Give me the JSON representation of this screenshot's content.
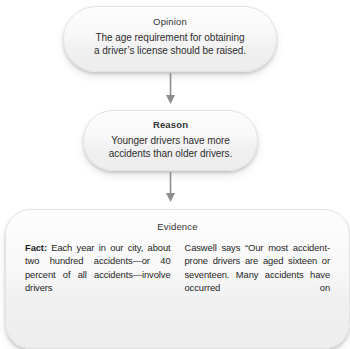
{
  "diagram": {
    "type": "flowchart-vertical",
    "nodes": [
      {
        "id": "opinion",
        "heading": "Opinion",
        "heading_bold": false,
        "lines": [
          "The age requirement for obtaining",
          "a driver’s license should be raised."
        ]
      },
      {
        "id": "reason",
        "heading": "Reason",
        "heading_bold": true,
        "lines": [
          "Younger drivers have more",
          "accidents than older drivers."
        ]
      },
      {
        "id": "evidence",
        "heading": "Evidence",
        "heading_bold": false,
        "columns": [
          {
            "id": "fact-column",
            "lead": "Fact:",
            "text": " Each year in our city, about two hundred accidents—or 40 percent of all accidents—involve drivers"
          },
          {
            "id": "quote-column",
            "lead": "",
            "text": "Caswell says “Our most accident-prone drivers are aged sixteen or seventeen. Many accidents have occurred on"
          }
        ]
      }
    ],
    "connectors": [
      {
        "id": "opinion-to-reason",
        "from": "opinion",
        "to": "reason",
        "direction": "down"
      },
      {
        "id": "reason-to-evidence",
        "from": "reason",
        "to": "evidence",
        "direction": "down"
      }
    ],
    "colors": {
      "node_fill_top": "#fdfdfd",
      "node_fill_bottom": "#ededed",
      "node_border": "#e2e2e2",
      "text": "#2e2e2e",
      "heading": "#333333",
      "arrow": "#8d8d8d",
      "background": "#ffffff"
    }
  }
}
